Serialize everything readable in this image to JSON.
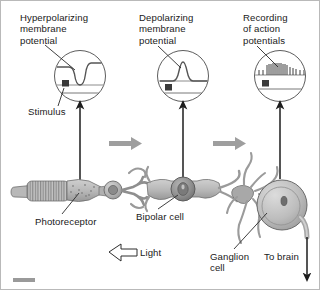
{
  "figure": {
    "background_color": "#ffffff",
    "border_color": "#b9b9b9"
  },
  "panels": [
    {
      "id": "panel-hyperpolarizing",
      "label": "Hyperpolarizing\nmembrane\npotential",
      "sub_label": "Stimulus",
      "trace_type": "downward-deflection",
      "description": "Inset circle showing membrane potential trace deflecting downward (hyperpolarization) with stimulus marker"
    },
    {
      "id": "panel-depolarizing",
      "label": "Depolarizing\nmembrane\npotential",
      "trace_type": "upward-deflection",
      "description": "Inset circle showing membrane potential trace deflecting upward (depolarization) with stimulus marker"
    },
    {
      "id": "panel-action-potentials",
      "label": "Recording\nof action\npotentials",
      "trace_type": "spike-train",
      "description": "Inset circle showing a burst of action potential spikes with stimulus marker"
    }
  ],
  "cells": [
    {
      "id": "photoreceptor",
      "label": "Photoreceptor"
    },
    {
      "id": "bipolar-cell",
      "label": "Bipolar cell"
    },
    {
      "id": "ganglion-cell",
      "label": "Ganglion\ncell"
    }
  ],
  "annotations": {
    "light_label": "Light",
    "to_brain_label": "To brain"
  },
  "colors": {
    "cell_fill": "#b3b3b3",
    "cell_fill_light": "#c8c8c8",
    "cell_fill_dark": "#8d8d8d",
    "nucleus": "#6f6f6f",
    "outline": "#6a6a6a",
    "flow_arrow": "#9e9e9e",
    "pointer_line": "#2a2a2a",
    "trace": "#555555",
    "text": "#1a1a1a",
    "scalebar": "#9a9a9a"
  }
}
